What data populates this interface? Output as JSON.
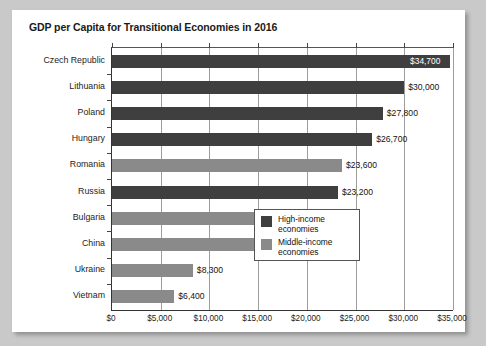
{
  "chart_data": {
    "type": "bar",
    "orientation": "horizontal",
    "title": "GDP per Capita for Transitional Economies in 2016",
    "xlabel": "",
    "ylabel": "",
    "xlim": [
      0,
      35000
    ],
    "xticks": [
      0,
      5000,
      10000,
      15000,
      20000,
      25000,
      30000,
      35000
    ],
    "xtick_labels": [
      "$0",
      "$5,000",
      "$10,000",
      "$15,000",
      "$20,000",
      "$25,000",
      "$30,000",
      "$35,000"
    ],
    "grid": "vertical",
    "categories": [
      "Czech Republic",
      "Lithuania",
      "Poland",
      "Hungary",
      "Romania",
      "Russia",
      "Bulgaria",
      "China",
      "Ukraine",
      "Vietnam"
    ],
    "values": [
      34700,
      30000,
      27800,
      26700,
      23600,
      23200,
      19200,
      15500,
      8300,
      6400
    ],
    "value_labels": [
      "$34,700",
      "$30,000",
      "$27,800",
      "$26,700",
      "$23,600",
      "$23,200",
      "$19,200",
      "$15,500",
      "$8,300",
      "$6,400"
    ],
    "groups": [
      "high",
      "high",
      "high",
      "high",
      "middle",
      "high",
      "middle",
      "middle",
      "middle",
      "middle"
    ],
    "label_placement": [
      "inside",
      "outside",
      "outside",
      "outside",
      "outside",
      "outside",
      "outside",
      "outside",
      "outside",
      "outside"
    ],
    "colors": {
      "high": "#3f3f3f",
      "middle": "#8a8a8a",
      "background": "#ffffff",
      "page": "#c9c9c9",
      "gridline": "#9d9d9d",
      "axis": "#333333"
    },
    "legend": {
      "position": "inside-lower-right",
      "entries": [
        {
          "key": "high",
          "label": "High-income\neconomies"
        },
        {
          "key": "middle",
          "label": "Middle-income\neconomies"
        }
      ]
    }
  }
}
